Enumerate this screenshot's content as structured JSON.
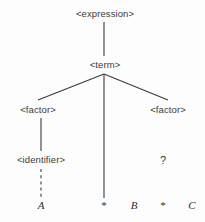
{
  "diagram": {
    "type": "parse-tree",
    "width": 205,
    "height": 222,
    "background_color": "#fdfdfd",
    "line_color": "#3a3a3a",
    "text_color": "#3a3a3a",
    "nonterminals": [
      {
        "id": "expression",
        "label": "<expression>",
        "x": 105,
        "y": 14
      },
      {
        "id": "term",
        "label": "<term>",
        "x": 105,
        "y": 65
      },
      {
        "id": "factor_left",
        "label": "<factor>",
        "x": 38,
        "y": 110
      },
      {
        "id": "factor_right",
        "label": "<factor>",
        "x": 168,
        "y": 110
      },
      {
        "id": "identifier",
        "label": "<identifier>",
        "x": 41,
        "y": 160
      }
    ],
    "placeholders": [
      {
        "id": "unknown_right",
        "label": "?",
        "x": 163,
        "y": 160
      }
    ],
    "terminals": [
      {
        "id": "term_a",
        "label": "A",
        "x": 41,
        "y": 205,
        "kind": "identifier"
      },
      {
        "id": "star_1",
        "label": "*",
        "x": 104,
        "y": 205,
        "kind": "operator"
      },
      {
        "id": "term_b",
        "label": "B",
        "x": 134,
        "y": 205,
        "kind": "identifier"
      },
      {
        "id": "star_2",
        "label": "*",
        "x": 163,
        "y": 205,
        "kind": "operator"
      },
      {
        "id": "term_c",
        "label": "C",
        "x": 192,
        "y": 205,
        "kind": "identifier"
      }
    ],
    "edges": [
      {
        "id": "expression-term",
        "from": "expression",
        "to": "term",
        "x1": 104,
        "y1": 22,
        "x2": 104,
        "y2": 56,
        "style": "solid"
      },
      {
        "id": "term-factor-left",
        "from": "term",
        "to": "factor_left",
        "x1": 104,
        "y1": 74,
        "x2": 38,
        "y2": 100,
        "style": "solid"
      },
      {
        "id": "term-star-1",
        "from": "term",
        "to": "star_1",
        "x1": 104,
        "y1": 74,
        "x2": 104,
        "y2": 198,
        "style": "solid"
      },
      {
        "id": "term-factor-right",
        "from": "term",
        "to": "factor_right",
        "x1": 104,
        "y1": 74,
        "x2": 168,
        "y2": 100,
        "style": "solid"
      },
      {
        "id": "factor-left-identifier",
        "from": "factor_left",
        "to": "identifier",
        "x1": 41,
        "y1": 118,
        "x2": 41,
        "y2": 151,
        "style": "solid"
      },
      {
        "id": "identifier-term-a",
        "from": "identifier",
        "to": "term_a",
        "x1": 41,
        "y1": 169,
        "x2": 41,
        "y2": 198,
        "style": "dashed"
      }
    ]
  }
}
